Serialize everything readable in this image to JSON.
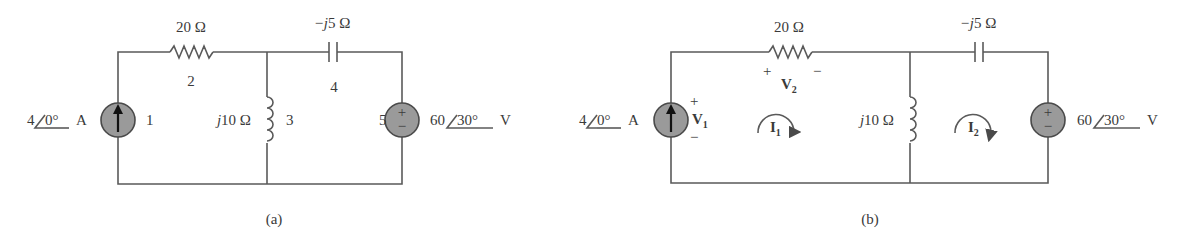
{
  "figure_a": {
    "caption": "(a)",
    "current_source": {
      "value": "4",
      "angle": "0°",
      "unit": "A",
      "node_label": "1"
    },
    "resistor": {
      "value": "20 Ω",
      "node_label": "2"
    },
    "inductor": {
      "value_prefix": "j",
      "value": "10 Ω",
      "node_label": "3"
    },
    "capacitor": {
      "value_prefix": "−j",
      "value": "5 Ω",
      "node_label": "4"
    },
    "voltage_source": {
      "value": "60",
      "angle": "30°",
      "unit": "V",
      "node_label": "5",
      "plus": "+",
      "minus": "−"
    }
  },
  "figure_b": {
    "caption": "(b)",
    "current_source": {
      "value": "4",
      "angle": "0°",
      "unit": "A"
    },
    "v1": {
      "plus": "+",
      "minus": "−",
      "symbol": "V",
      "subscript": "1"
    },
    "resistor": {
      "value": "20 Ω"
    },
    "v2": {
      "plus": "+",
      "minus": "−",
      "symbol": "V",
      "subscript": "2"
    },
    "inductor": {
      "value_prefix": "j",
      "value": "10 Ω"
    },
    "capacitor": {
      "value_prefix": "−j",
      "value": "5 Ω"
    },
    "voltage_source": {
      "value": "60",
      "angle": "30°",
      "unit": "V",
      "plus": "+",
      "minus": "−"
    },
    "mesh1": {
      "symbol": "I",
      "subscript": "1"
    },
    "mesh2": {
      "symbol": "I",
      "subscript": "2"
    }
  }
}
